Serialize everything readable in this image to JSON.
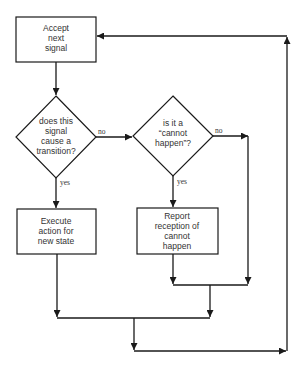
{
  "diagram": {
    "type": "flowchart",
    "nodes": {
      "accept": {
        "shape": "rect",
        "lines": [
          "Accept",
          "next",
          "signal"
        ]
      },
      "transition": {
        "shape": "diamond",
        "lines": [
          "does this",
          "signal",
          "cause a",
          "transition?"
        ]
      },
      "cannot_happen": {
        "shape": "diamond",
        "lines": [
          "is it a",
          "“cannot",
          "happen”?"
        ]
      },
      "execute": {
        "shape": "rect",
        "lines": [
          "Execute",
          "action for",
          "new state"
        ]
      },
      "report": {
        "shape": "rect",
        "lines": [
          "Report",
          "reception of",
          "cannot",
          "happen"
        ]
      }
    },
    "edge_labels": {
      "transition_no": "no",
      "transition_yes": "yes",
      "cannot_no": "no",
      "cannot_yes": "yes"
    },
    "colors": {
      "stroke": "#1a1a1a",
      "fill": "#ffffff",
      "text": "#333333"
    }
  }
}
